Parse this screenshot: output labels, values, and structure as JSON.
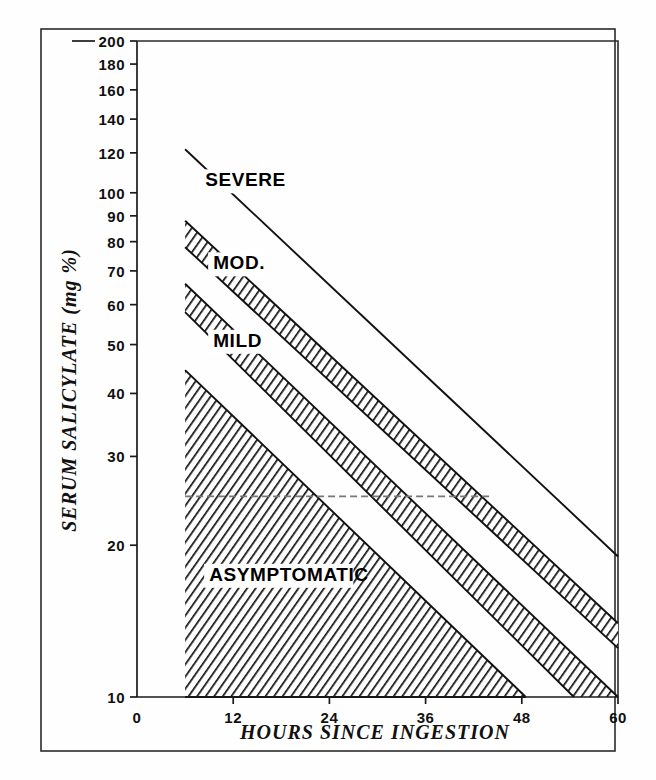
{
  "figure": {
    "background_color": "#fefefe",
    "line_color": "#111111"
  },
  "axes": {
    "y": {
      "label": "SERUM SALICYLATE (mg %)",
      "scale": "log",
      "range": [
        10,
        200
      ],
      "ticks": [
        200,
        180,
        160,
        140,
        120,
        100,
        90,
        80,
        70,
        60,
        50,
        40,
        30,
        20,
        10
      ],
      "tick_labels": [
        "200",
        "180",
        "160",
        "140",
        "120",
        "100",
        "90",
        "80",
        "70",
        "60",
        "50",
        "40",
        "30",
        "20",
        "10"
      ]
    },
    "x": {
      "label": "HOURS SINCE INGESTION",
      "scale": "linear",
      "range": [
        0,
        60
      ],
      "ticks": [
        0,
        12,
        24,
        36,
        48,
        60
      ],
      "tick_labels": [
        "0",
        "12",
        "24",
        "36",
        "48",
        "60"
      ]
    }
  },
  "band_labels": [
    {
      "name": "severe",
      "text": "SEVERE",
      "x_hours": 8.5,
      "y_value": 103
    },
    {
      "name": "moderate",
      "text": "MOD.",
      "x_hours": 9.5,
      "y_value": 70.5
    },
    {
      "name": "mild",
      "text": "MILD",
      "x_hours": 9.5,
      "y_value": 49.5
    },
    {
      "name": "asymptomatic",
      "text": "ASYMPTOMATIC",
      "x_hours": 9.0,
      "y_value": 17.0
    }
  ],
  "chart_data": {
    "type": "area",
    "xlabel": "HOURS SINCE INGESTION",
    "ylabel": "SERUM SALICYLATE (mg %)",
    "xlim": [
      0,
      60
    ],
    "ylim": [
      10,
      200
    ],
    "yscale": "log",
    "xscale": "linear",
    "grid": false,
    "legend": "in-plot band labels",
    "series": [
      {
        "name": "severe upper boundary",
        "kind": "line",
        "style": "solid",
        "points": [
          [
            6,
            122
          ],
          [
            60,
            19
          ]
        ]
      },
      {
        "name": "severe / moderate boundary (hatched band top)",
        "kind": "band",
        "style": "hatched",
        "upper_points": [
          [
            6,
            88
          ],
          [
            60,
            14
          ]
        ],
        "lower_points": [
          [
            6,
            78
          ],
          [
            60,
            12.5
          ]
        ]
      },
      {
        "name": "moderate / mild boundary (hatched band)",
        "kind": "band",
        "style": "hatched",
        "upper_points": [
          [
            6,
            66
          ],
          [
            60,
            10
          ]
        ],
        "lower_points": [
          [
            6,
            58
          ],
          [
            54.5,
            10
          ]
        ]
      },
      {
        "name": "mild / asymptomatic region (hatched)",
        "kind": "band",
        "style": "hatched",
        "upper_points": [
          [
            6,
            44.5
          ],
          [
            48.5,
            10
          ]
        ],
        "lower_points": [
          [
            6,
            10
          ],
          [
            48.5,
            10
          ]
        ]
      },
      {
        "name": "25 mg% reference line",
        "kind": "line",
        "style": "dashed",
        "points": [
          [
            6,
            25
          ],
          [
            44,
            25
          ]
        ]
      }
    ],
    "zones": [
      {
        "label": "SEVERE",
        "description": "above the upper hatched band"
      },
      {
        "label": "MOD.",
        "description": "between severe and mild bands"
      },
      {
        "label": "MILD",
        "description": "between moderate and asymptomatic"
      },
      {
        "label": "ASYMPTOMATIC",
        "description": "lowest hatched region"
      }
    ]
  }
}
